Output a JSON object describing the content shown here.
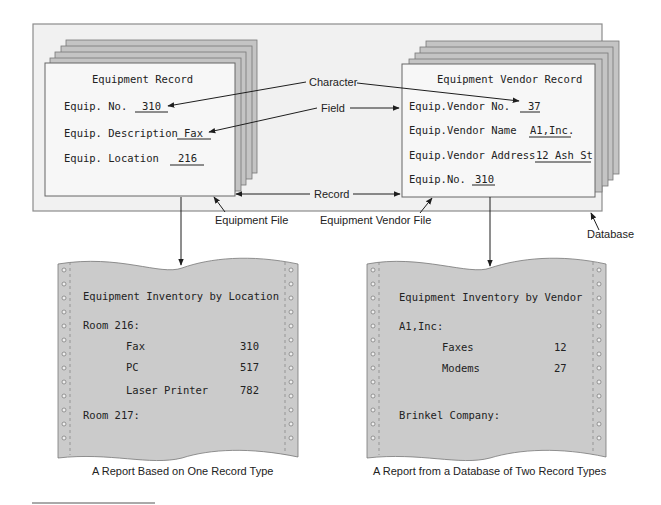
{
  "colors": {
    "database_bg": "#f1f1f1",
    "database_border": "#8c8c8c",
    "record_bg": "#f7f7f7",
    "stack_bg": "#c4c4c4",
    "paper_bg": "#cbcbcb",
    "line": "#1e1e1e"
  },
  "equipment_record": {
    "title": "Equipment Record",
    "fields": [
      {
        "label": "Equip. No.",
        "value": "310"
      },
      {
        "label": "Equip. Description",
        "value": "Fax"
      },
      {
        "label": "Equip. Location",
        "value": "216"
      }
    ]
  },
  "vendor_record": {
    "title": "Equipment Vendor Record",
    "fields": [
      {
        "label": "Equip.Vendor No.",
        "value": "37"
      },
      {
        "label": "Equip.Vendor Name",
        "value": "A1,Inc."
      },
      {
        "label": "Equip.Vendor Address",
        "value": "12 Ash St"
      },
      {
        "label": "Equip.No.",
        "value": "310"
      }
    ]
  },
  "labels": {
    "character": "Character",
    "field": "Field",
    "record": "Record",
    "equipment_file": "Equipment File",
    "equipment_vendor_file": "Equipment Vendor File",
    "database": "Database"
  },
  "report_location": {
    "title": "Equipment Inventory by Location",
    "group1": "Room 216:",
    "rows": [
      {
        "item": "Fax",
        "value": "310"
      },
      {
        "item": "PC",
        "value": "517"
      },
      {
        "item": "Laser Printer",
        "value": "782"
      }
    ],
    "group2": "Room 217:",
    "caption": "A Report Based on One Record Type"
  },
  "report_vendor": {
    "title": "Equipment Inventory by Vendor",
    "group1": "A1,Inc:",
    "rows": [
      {
        "item": "Faxes",
        "value": "12"
      },
      {
        "item": "Modems",
        "value": "27"
      }
    ],
    "group2": "Brinkel Company:",
    "caption": "A Report from a Database of Two Record Types"
  }
}
